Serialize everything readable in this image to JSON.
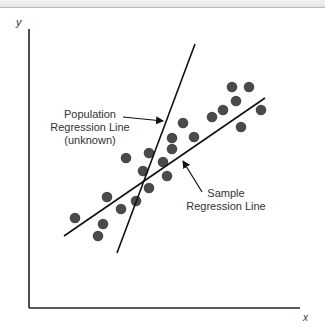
{
  "chart_data": {
    "type": "scatter",
    "title": "",
    "xlabel": "x",
    "ylabel": "y",
    "grid": false,
    "legend": null,
    "points": [
      {
        "x": 75,
        "y": 218
      },
      {
        "x": 98,
        "y": 236
      },
      {
        "x": 103,
        "y": 224
      },
      {
        "x": 107,
        "y": 197
      },
      {
        "x": 121,
        "y": 209
      },
      {
        "x": 126,
        "y": 158
      },
      {
        "x": 136,
        "y": 201
      },
      {
        "x": 143,
        "y": 171
      },
      {
        "x": 149,
        "y": 153
      },
      {
        "x": 149,
        "y": 188
      },
      {
        "x": 163,
        "y": 162
      },
      {
        "x": 167,
        "y": 176
      },
      {
        "x": 172,
        "y": 138
      },
      {
        "x": 172,
        "y": 149
      },
      {
        "x": 183,
        "y": 123
      },
      {
        "x": 194,
        "y": 137
      },
      {
        "x": 212,
        "y": 117
      },
      {
        "x": 223,
        "y": 110
      },
      {
        "x": 236,
        "y": 101
      },
      {
        "x": 232,
        "y": 87
      },
      {
        "x": 249,
        "y": 87
      },
      {
        "x": 241,
        "y": 127
      },
      {
        "x": 261,
        "y": 110
      }
    ],
    "lines": [
      {
        "name": "Population Regression Line (unknown)",
        "x1": 117,
        "y1": 253,
        "x2": 195,
        "y2": 44
      },
      {
        "name": "Sample Regression Line",
        "x1": 64,
        "y1": 236,
        "x2": 265,
        "y2": 98
      }
    ],
    "annotations": [
      {
        "text_lines": [
          "Population",
          "Regression Line",
          "(unknown)"
        ],
        "arrow_to": [
          163,
          121
        ]
      },
      {
        "text_lines": [
          "Sample",
          "Regression Line"
        ],
        "arrow_to": [
          183,
          160
        ]
      }
    ],
    "note": "Conceptual diagram; coordinates are in pixel space, no numeric tick labels shown."
  },
  "axes": {
    "x_label": "x",
    "y_label": "y"
  },
  "annotations": {
    "population": {
      "line1": "Population",
      "line2": "Regression Line",
      "line3": "(unknown)"
    },
    "sample": {
      "line1": "Sample",
      "line2": "Regression Line"
    }
  },
  "colors": {
    "dot": "#4a4a4a",
    "line": "#111111",
    "axis": "#222222"
  }
}
